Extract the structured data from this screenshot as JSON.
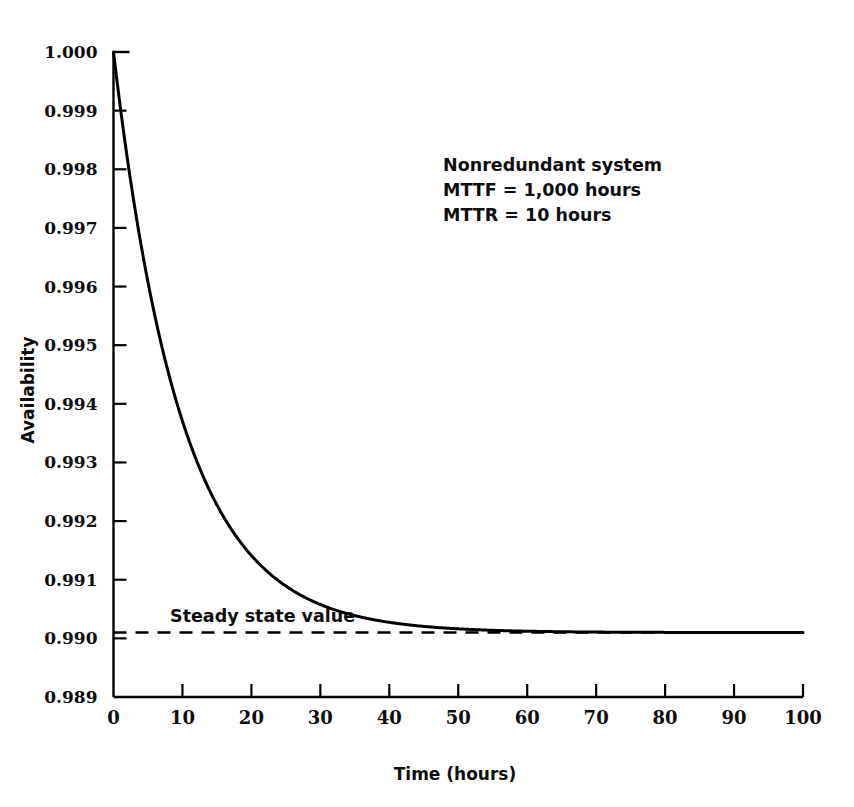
{
  "chart_data": {
    "type": "line",
    "title": "",
    "xlabel": "Time (hours)",
    "ylabel": "Availability",
    "xlim": [
      0,
      100
    ],
    "ylim": [
      0.989,
      1.0
    ],
    "grid": false,
    "legend": "none",
    "x_ticks": [
      "0",
      "10",
      "20",
      "30",
      "40",
      "50",
      "60",
      "70",
      "80",
      "90",
      "100"
    ],
    "x_tick_values": [
      0,
      10,
      20,
      30,
      40,
      50,
      60,
      70,
      80,
      90,
      100
    ],
    "y_ticks": [
      "1.000",
      "0.999",
      "0.998",
      "0.997",
      "0.996",
      "0.995",
      "0.994",
      "0.993",
      "0.992",
      "0.991",
      "0.990",
      "0.989"
    ],
    "y_tick_values": [
      1.0,
      0.999,
      0.998,
      0.997,
      0.996,
      0.995,
      0.994,
      0.993,
      0.992,
      0.991,
      0.99,
      0.989
    ],
    "series": [
      {
        "name": "Instantaneous availability",
        "model": "A(t) = 0.990099 + 0.009901 * exp(-0.101 * t)",
        "color": "#000000",
        "style": "solid",
        "x": [
          0,
          1,
          2,
          3,
          4,
          5,
          6,
          7,
          8,
          9,
          10,
          12,
          14,
          16,
          18,
          20,
          22,
          24,
          26,
          28,
          30,
          33,
          36,
          39,
          42,
          45,
          48,
          51,
          54,
          57,
          60,
          65,
          70,
          75,
          80,
          85,
          90,
          95,
          100
        ],
        "y": [
          1.0,
          0.998951,
          0.997999,
          0.997139,
          0.996361,
          0.995657,
          0.99502,
          0.994445,
          0.993925,
          0.993455,
          0.993029,
          0.992294,
          0.991693,
          0.991202,
          0.990801,
          0.990473,
          0.990206,
          0.989987,
          0.989809,
          0.989664,
          0.989546,
          0.989413,
          0.989315,
          0.989243,
          0.98919,
          0.989151,
          0.989123,
          0.989102,
          0.989087,
          0.989076,
          0.989067,
          0.989057,
          0.989051,
          0.989046,
          0.989043,
          0.989041,
          0.98904,
          0.989039,
          0.989038
        ]
      },
      {
        "name": "Steady state value",
        "model": "A(inf) = MTTF / (MTTF + MTTR) = 1000 / 1010",
        "value": 0.990099,
        "color": "#000000",
        "style": "dashed"
      }
    ],
    "annotations": [
      {
        "name": "steady-state-label",
        "text": "Steady state value",
        "x": 8.5,
        "y": 0.99045
      },
      {
        "name": "parameters-line-1",
        "text": "Nonredundant system",
        "x": 48,
        "y": 0.99795
      },
      {
        "name": "parameters-line-2",
        "text": "MTTF  =  1,000 hours",
        "x": 48,
        "y": 0.99755
      },
      {
        "name": "parameters-line-3",
        "text": "MTTR  =  10 hours",
        "x": 48,
        "y": 0.99715
      }
    ]
  },
  "axes": {
    "x_title": "Time (hours)",
    "y_title": "Availability"
  },
  "annotation_box": {
    "line1": "Nonredundant system",
    "line2": "MTTF  =  1,000 hours",
    "line3": "MTTR  =  10 hours"
  },
  "steady_state": {
    "label": "Steady state value"
  },
  "colors": {
    "curve": "#000000",
    "axis": "#000000",
    "text": "#0d0d0d",
    "background": "#ffffff"
  }
}
